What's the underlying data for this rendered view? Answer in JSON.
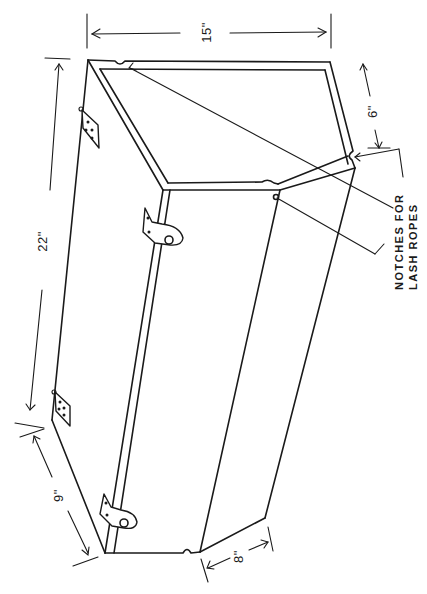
{
  "figure": {
    "stroke_color": "#1a1a1a",
    "background": "#ffffff"
  },
  "dimensions": {
    "top_width": "15\"",
    "side_front": "6\"",
    "length": "22\"",
    "end_top": "9\"",
    "end_bottom": "8\""
  },
  "callout": {
    "line1": "NOTCHES FOR",
    "line2": "LASH ROPES"
  }
}
